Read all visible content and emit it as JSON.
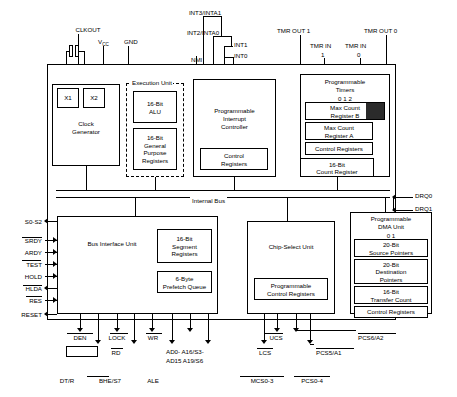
{
  "blocks": [
    {
      "id": "clock_generator",
      "label": "Clock\nGenerator"
    },
    {
      "id": "x1",
      "label": "X1"
    },
    {
      "id": "x2",
      "label": "X2"
    },
    {
      "id": "execution_unit",
      "label": "Execution Unit"
    },
    {
      "id": "alu",
      "label": "16-Bit\nALU"
    },
    {
      "id": "gpr",
      "label": "16-Bit\nGeneral\nPurpose\nRegisters"
    },
    {
      "id": "pic",
      "label": "Programmable\nInterrupt\nController"
    },
    {
      "id": "pic_control",
      "label": "Control\nRegisters"
    },
    {
      "id": "timers",
      "label": "Programmable\nTimers"
    },
    {
      "id": "timer_index",
      "label": "0   1    2"
    },
    {
      "id": "max_count_b",
      "label": "Max Count\nRegister B"
    },
    {
      "id": "max_count_a",
      "label": "Max Count\nRegister A"
    },
    {
      "id": "timer_control",
      "label": "Control Registers"
    },
    {
      "id": "count_register",
      "label": "16-Bit\nCount Register"
    },
    {
      "id": "biu",
      "label": "Bus Interface Unit"
    },
    {
      "id": "segment_registers",
      "label": "16-Bit\nSegment\nRegisters"
    },
    {
      "id": "prefetch_queue",
      "label": "6-Byte\nPrefetch Queue"
    },
    {
      "id": "chip_select_unit",
      "label": "Chip-Select Unit"
    },
    {
      "id": "cs_control",
      "label": "Programmable\nControl Registers"
    },
    {
      "id": "dma_unit",
      "label": "Programmable\nDMA Unit"
    },
    {
      "id": "dma_index",
      "label": "0    1"
    },
    {
      "id": "source_pointers",
      "label": "20-Bit\nSource Pointers"
    },
    {
      "id": "dest_pointers",
      "label": "20-Bit\nDestination\nPointers"
    },
    {
      "id": "transfer_count",
      "label": "16-Bit\nTransfer Count"
    },
    {
      "id": "dma_control",
      "label": "Control Registers"
    }
  ],
  "bus_label": "Internal Bus",
  "signals_top": [
    {
      "id": "clkout",
      "label": "CLKOUT"
    },
    {
      "id": "vcc",
      "label": "V"
    },
    {
      "id": "vcc_sub",
      "label": "CC"
    },
    {
      "id": "gnd",
      "label": "GND"
    },
    {
      "id": "int3_inta1",
      "label": "INT3/INTA1"
    },
    {
      "id": "int2_inta0",
      "label": "INT2/INTA0"
    },
    {
      "id": "int1",
      "label": "INT1"
    },
    {
      "id": "int0",
      "label": "INT0"
    },
    {
      "id": "nmi",
      "label": "NMI"
    },
    {
      "id": "tmr_out_1",
      "label": "TMR OUT 1"
    },
    {
      "id": "tmr_out_0",
      "label": "TMR OUT 0"
    },
    {
      "id": "tmr_in_1",
      "label": "TMR IN"
    },
    {
      "id": "tmr_in_1_num",
      "label": "1"
    },
    {
      "id": "tmr_in_0",
      "label": "TMR IN"
    },
    {
      "id": "tmr_in_0_num",
      "label": "0"
    }
  ],
  "signals_left": [
    {
      "id": "s0_s2",
      "label": "S0-S2"
    },
    {
      "id": "srdy",
      "label": "SRDY"
    },
    {
      "id": "ardy",
      "label": "ARDY"
    },
    {
      "id": "test",
      "label": "TEST"
    },
    {
      "id": "hold",
      "label": "HOLD"
    },
    {
      "id": "hlda",
      "label": "HLDA"
    },
    {
      "id": "res",
      "label": "RES"
    },
    {
      "id": "reset",
      "label": "RESET"
    }
  ],
  "signals_right": [
    {
      "id": "drq0",
      "label": "DRQ0"
    },
    {
      "id": "drq1",
      "label": "DRQ1"
    }
  ],
  "signals_bottom": [
    {
      "id": "den",
      "label": "DEN"
    },
    {
      "id": "wr",
      "label": "WR"
    },
    {
      "id": "lock",
      "label": "LOCK"
    },
    {
      "id": "rd",
      "label": "RD"
    },
    {
      "id": "dt_r",
      "label": "DT/R"
    },
    {
      "id": "bhe_s7",
      "label": "BHE/S7"
    },
    {
      "id": "ale",
      "label": "ALE"
    },
    {
      "id": "ad0_ad15",
      "label": "AD0- A16/S3-"
    },
    {
      "id": "ad15_a19",
      "label": "AD15  A19/S6"
    },
    {
      "id": "ucs",
      "label": "UCS"
    },
    {
      "id": "lcs",
      "label": "LCS"
    },
    {
      "id": "pcs6_a2",
      "label": "PCS6/A2"
    },
    {
      "id": "pcs5_a1",
      "label": "PCS5/A1"
    },
    {
      "id": "mcs0_3",
      "label": "MCS0-3"
    },
    {
      "id": "pcs0_4",
      "label": "PCS0-4"
    }
  ]
}
